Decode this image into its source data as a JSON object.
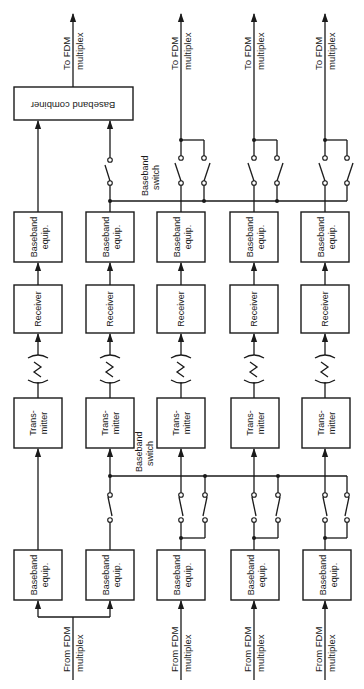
{
  "diagram": {
    "type": "block-diagram",
    "orientation": "rotated-90-ccw",
    "channels": [
      {
        "id": 1,
        "role": "protection-combined"
      },
      {
        "id": 2,
        "role": "protection-switched"
      },
      {
        "id": 3,
        "role": "working"
      },
      {
        "id": 4,
        "role": "working"
      },
      {
        "id": 5,
        "role": "working"
      }
    ],
    "labels": {
      "to_fdm_line1": "To FDM",
      "to_fdm_line2": "multiplex",
      "from_fdm_line1": "From FDM",
      "from_fdm_line2": "multiplex",
      "baseband_combiner": "Baseband combiner",
      "baseband_switch_line1": "Baseband",
      "baseband_switch_line2": "switch",
      "baseband_equip_line1": "Baseband",
      "baseband_equip_line2": "equip.",
      "receiver": "Receiver",
      "transmitter_line1": "Trans-",
      "transmitter_line2": "mitter"
    },
    "blocks_per_channel": [
      "Baseband equip. (tx)",
      "Transmitter",
      "Radio path",
      "Receiver",
      "Baseband equip. (rx)"
    ],
    "colors": {
      "line": "#1a1a1a",
      "background": "#ffffff"
    }
  }
}
